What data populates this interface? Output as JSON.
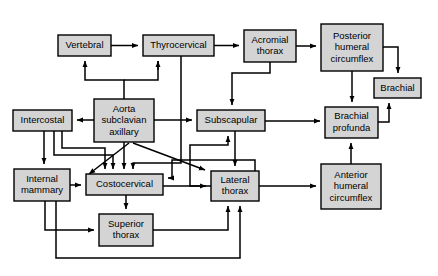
{
  "diagram": {
    "background_color": "#ffffff",
    "node_fill_color": "#d4d4d4",
    "node_stroke_color": "#000000",
    "nodes": [
      {
        "id": "vertebral",
        "label": "Vertebral",
        "lines": [
          "Vertebral"
        ],
        "x": 58,
        "y": 35,
        "w": 53,
        "h": 21
      },
      {
        "id": "thyrocervical",
        "label": "Thyrocervical",
        "lines": [
          "Thyrocervical"
        ],
        "x": 143,
        "y": 35,
        "w": 71,
        "h": 21
      },
      {
        "id": "acromial",
        "label": "Acromial thorax",
        "lines": [
          "Acromial",
          "thorax"
        ],
        "x": 244,
        "y": 30,
        "w": 52,
        "h": 32
      },
      {
        "id": "posthumcirc",
        "label": "Posterior humeral circumflex",
        "lines": [
          "Posterior",
          "humeral",
          "circumflex"
        ],
        "x": 321,
        "y": 24,
        "w": 62,
        "h": 47
      },
      {
        "id": "brachial",
        "label": "Brachial",
        "lines": [
          "Brachial"
        ],
        "x": 374,
        "y": 78,
        "w": 47,
        "h": 20
      },
      {
        "id": "intercostal",
        "label": "Intercostal",
        "lines": [
          "Intercostal"
        ],
        "x": 13,
        "y": 110,
        "w": 59,
        "h": 21
      },
      {
        "id": "aorta",
        "label": "Aorta subclavian axillary",
        "lines": [
          "Aorta",
          "subclavian",
          "axillary"
        ],
        "x": 94,
        "y": 99,
        "w": 60,
        "h": 43
      },
      {
        "id": "subscapular",
        "label": "Subscapular",
        "lines": [
          "Subscapular"
        ],
        "x": 197,
        "y": 110,
        "w": 68,
        "h": 21
      },
      {
        "id": "brachprof",
        "label": "Brachial profunda",
        "lines": [
          "Brachial",
          "profunda"
        ],
        "x": 325,
        "y": 107,
        "w": 53,
        "h": 31
      },
      {
        "id": "intmammary",
        "label": "Internal mammary",
        "lines": [
          "Internal",
          "mammary"
        ],
        "x": 14,
        "y": 169,
        "w": 56,
        "h": 32
      },
      {
        "id": "costocervical",
        "label": "Costocervical",
        "lines": [
          "Costocervical"
        ],
        "x": 86,
        "y": 174,
        "w": 77,
        "h": 21
      },
      {
        "id": "lateralthorax",
        "label": "Lateral thorax",
        "lines": [
          "Lateral",
          "thorax"
        ],
        "x": 211,
        "y": 171,
        "w": 48,
        "h": 30
      },
      {
        "id": "anthumcirc",
        "label": "Anterior humeral circumflex",
        "lines": [
          "Anterior",
          "humeral",
          "circumflex"
        ],
        "x": 321,
        "y": 164,
        "w": 60,
        "h": 45
      },
      {
        "id": "superiorthorax",
        "label": "Superior thorax",
        "lines": [
          "Superior",
          "thorax"
        ],
        "x": 99,
        "y": 214,
        "w": 54,
        "h": 32
      }
    ],
    "edges": [
      {
        "id": "e-vertebral-thyrocervical",
        "from": "vertebral",
        "to": "thyrocervical",
        "path": "M111,45.5 L138,45.5",
        "arrow": true
      },
      {
        "id": "e-thyro-acromial",
        "from": "thyrocervical",
        "to": "acromial",
        "path": "M214,45.5 L239,45.5",
        "arrow": true
      },
      {
        "id": "e-acromial-posthum",
        "from": "acromial",
        "to": "posthumcirc",
        "path": "M296,46 L316,46",
        "arrow": true
      },
      {
        "id": "e-posthum-brachial",
        "from": "posthumcirc",
        "to": "brachial",
        "path": "M383,47 L398,47 L398,73",
        "arrow": true
      },
      {
        "id": "e-posthum-brachprof",
        "from": "posthumcirc",
        "to": "brachprof",
        "path": "M352,71 L352,102",
        "arrow": true
      },
      {
        "id": "e-brachprof-brachial",
        "from": "brachprof",
        "to": "brachial",
        "path": "M378,122 L389,122 L389,103",
        "arrow": true
      },
      {
        "id": "e-aorta-vertebral",
        "from": "aorta",
        "to": "vertebral",
        "path": "M124,99 L124,80 L85,80 L85,61",
        "arrow": true
      },
      {
        "id": "e-aorta-thyrocervical",
        "from": "aorta",
        "to": "thyrocervical",
        "path": "M124,80 L158,80 L158,61",
        "arrow": false
      },
      {
        "id": "e-aorta-thyro-head",
        "from": "aorta",
        "to": "thyrocervical",
        "path": "M158,70 L158,61",
        "arrow": true
      },
      {
        "id": "e-aorta-intercostal",
        "from": "aorta",
        "to": "intercostal",
        "path": "M94,120 L77,120",
        "arrow": true
      },
      {
        "id": "e-aorta-subscapular",
        "from": "aorta",
        "to": "subscapular",
        "path": "M154,120 L192,120",
        "arrow": true
      },
      {
        "id": "e-aorta-costocervical",
        "from": "aorta",
        "to": "costocervical",
        "path": "M124,142 L124,169",
        "arrow": true
      },
      {
        "id": "e-aorta-intmammary",
        "from": "aorta",
        "to": "intmammary",
        "path": "M129,143 L89,174",
        "arrow": true
      },
      {
        "id": "e-aorta-lateralthorax",
        "from": "aorta",
        "to": "lateralthorax",
        "path": "M133,143 L205,170",
        "arrow": true
      },
      {
        "id": "e-thyro-costocervical",
        "from": "thyrocervical",
        "to": "costocervical",
        "path": "M181,56 L181,163 L133,163 L133,169",
        "arrow": true
      },
      {
        "id": "e-acromial-subscapular",
        "from": "acromial",
        "to": "subscapular",
        "path": "M270,62 L270,73 L232,73 L232,105",
        "arrow": true
      },
      {
        "id": "e-intercostal-intmammary",
        "from": "intercostal",
        "to": "intmammary",
        "path": "M44,131 L44,164",
        "arrow": true
      },
      {
        "id": "e-intercostal-costocervical",
        "from": "intercostal",
        "to": "costocervical",
        "path": "M54,131 L54,155 L113,155 L113,169",
        "arrow": true
      },
      {
        "id": "e-intercostal-loop",
        "from": "intercostal",
        "to": "costocervical",
        "path": "M62,131 L62,148 L105,148 L105,169",
        "arrow": true
      },
      {
        "id": "e-subscapular-brachprof",
        "from": "subscapular",
        "to": "brachprof",
        "path": "M265,121 L320,121",
        "arrow": true
      },
      {
        "id": "e-subscapular-lateral",
        "from": "subscapular",
        "to": "lateralthorax",
        "path": "M235,131 L235,166",
        "arrow": true
      },
      {
        "id": "e-lateral-subscapular",
        "from": "lateralthorax",
        "to": "subscapular",
        "path": "M211,186 L190,186 L190,145 L228,145 L228,136",
        "arrow": true
      },
      {
        "id": "e-intmammary-costocervical",
        "from": "intmammary",
        "to": "costocervical",
        "path": "M70,185 L81,185",
        "arrow": true
      },
      {
        "id": "e-costo-lateralthorax",
        "from": "costocervical",
        "to": "lateralthorax",
        "path": "M163,186 L206,186",
        "arrow": true
      },
      {
        "id": "e-costo-superiorthorax",
        "from": "costocervical",
        "to": "superiorthorax",
        "path": "M126,195 L126,209",
        "arrow": true
      },
      {
        "id": "e-lateral-anthum",
        "from": "lateralthorax",
        "to": "anthumcirc",
        "path": "M259,186 L316,186",
        "arrow": true
      },
      {
        "id": "e-anthum-brachprof",
        "from": "anthumcirc",
        "to": "brachprof",
        "path": "M351,164 L351,143",
        "arrow": true
      },
      {
        "id": "e-intmammary-superior",
        "from": "intmammary",
        "to": "superiorthorax",
        "path": "M45,201 L45,230 L94,230",
        "arrow": true
      },
      {
        "id": "e-superior-lateral",
        "from": "superiorthorax",
        "to": "lateralthorax",
        "path": "M153,230 L228,230 L228,206",
        "arrow": true
      },
      {
        "id": "e-intmammary-lateral",
        "from": "intmammary",
        "to": "lateralthorax",
        "path": "M56,201 L56,258 L240,258 L240,206",
        "arrow": true
      },
      {
        "id": "e-costo-from-right",
        "from": "lateralthorax",
        "to": "costocervical",
        "path": "M255,171 L255,160 L172,160 L172,178 L168,178",
        "arrow": true
      }
    ]
  }
}
